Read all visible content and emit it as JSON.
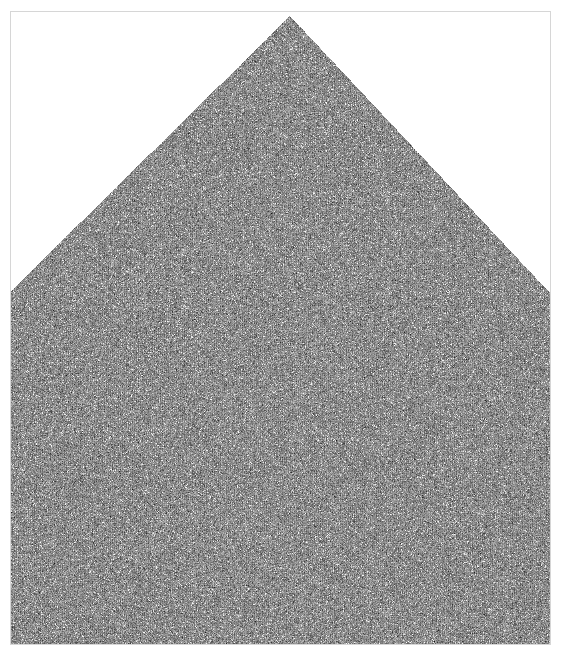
{
  "figure": {
    "title": "",
    "width": 562,
    "height": 664,
    "background_color": "#ffffff",
    "frame": {
      "color": "#d6d6d6",
      "line_width": 1,
      "left": 10,
      "top": 11,
      "width": 541,
      "height": 634
    }
  },
  "chart_data": {
    "type": "heatmap",
    "title": "",
    "subtitle": "",
    "xlabel": "",
    "ylabel": "",
    "grid": false,
    "legend": "none",
    "tick_labels_x": [],
    "tick_labels_y": [],
    "colormap": "gray",
    "value_range": [
      0,
      1
    ],
    "base_gray": "#8a8a8a",
    "speckle_color": "#ffffff",
    "noise_mean": 0.54,
    "noise_std": 0.11,
    "speckle_fraction": 0.035,
    "shape": {
      "name": "pentagon-tent",
      "apex": [
        290,
        16
      ],
      "left_shoulder": [
        11,
        291
      ],
      "right_shoulder": [
        550,
        293
      ],
      "bottom_left": [
        11,
        644
      ],
      "bottom_right": [
        550,
        644
      ],
      "polygon": [
        [
          290,
          16
        ],
        [
          550,
          293
        ],
        [
          550,
          644
        ],
        [
          11,
          644
        ],
        [
          11,
          291
        ]
      ]
    },
    "streaks": {
      "present": true,
      "orientation_degrees": 45,
      "region": "left-slope",
      "count": 9,
      "brightness_boost": 0.22,
      "offsets": [
        -6,
        10,
        26,
        44,
        66,
        92,
        124,
        165,
        210
      ]
    }
  },
  "accessibility": {
    "alt_text": "Grayscale noise texture in a pentagonal tent shape on a white background"
  }
}
